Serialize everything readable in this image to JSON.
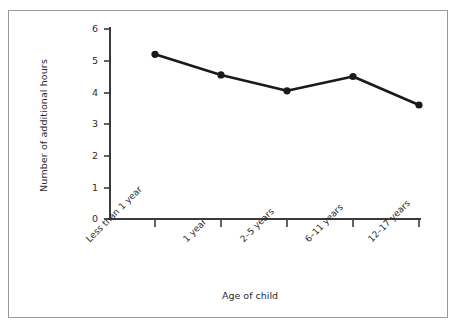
{
  "chart_data": {
    "type": "line",
    "title": "",
    "subtitle": "",
    "xlabel": "Age of child",
    "ylabel": "Number of additional hours",
    "categories": [
      "Less than 1 year",
      "1 year",
      "2–5 years",
      "6–11 years",
      "12–17 years"
    ],
    "values": [
      5.2,
      4.55,
      4.05,
      4.5,
      3.6
    ],
    "series": [
      {
        "name": "Number of additional hours",
        "values": [
          5.2,
          4.55,
          4.05,
          4.5,
          3.6
        ]
      }
    ],
    "ylim": [
      0,
      6
    ],
    "yticks": [
      "0",
      "1",
      "2",
      "3",
      "4",
      "5",
      "6"
    ],
    "ytick_values": [
      0,
      1,
      2,
      3,
      4,
      5,
      6
    ],
    "grid": false,
    "legend": "none",
    "line_color": "#1a1a1a",
    "marker_color": "#1a1a1a",
    "marker_shape": "circle",
    "axis_color": "#3a3a3a",
    "frame_color": "#9a9a9a",
    "background_color": "#ffffff"
  },
  "axes": {
    "y_title": "Number of additional hours",
    "x_title": "Age of child",
    "y_tick_labels": [
      "6",
      "5",
      "4",
      "3",
      "2",
      "1",
      "0"
    ],
    "x_tick_labels": [
      "Less than 1 year",
      "1 year",
      "2–5 years",
      "6–11 years",
      "12–17 years"
    ]
  }
}
